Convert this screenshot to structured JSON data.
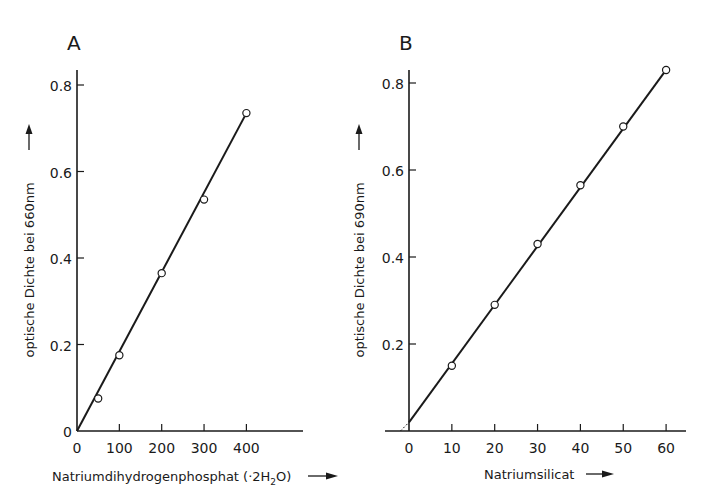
{
  "chart_data": [
    {
      "panel": "A",
      "type": "line",
      "title": "A",
      "xlabel": "Natriumdihydrogenphosphat (·2H2O)",
      "ylabel": "optische Dichte bei 660nm",
      "x_ticks": [
        0,
        100,
        200,
        300,
        400
      ],
      "y_ticks": [
        0,
        0.2,
        0.4,
        0.6,
        0.8
      ],
      "y_tick_labels": [
        "0",
        "0.2",
        "0.4",
        "0.6",
        "0.8"
      ],
      "xlim": [
        0,
        520
      ],
      "ylim": [
        0,
        0.84
      ],
      "grid": false,
      "series": [
        {
          "name": "Messpunkte",
          "x": [
            50,
            100,
            200,
            300,
            400
          ],
          "values": [
            0.075,
            0.175,
            0.365,
            0.535,
            0.735
          ]
        }
      ],
      "fit_line": {
        "x": [
          0,
          400
        ],
        "y": [
          0.0,
          0.735
        ]
      }
    },
    {
      "panel": "B",
      "type": "line",
      "title": "B",
      "xlabel": "Natriumsilicat",
      "ylabel": "optische Dichte bei 690nm",
      "x_ticks": [
        0,
        10,
        20,
        30,
        40,
        50,
        60
      ],
      "y_ticks": [
        0.2,
        0.4,
        0.6,
        0.8
      ],
      "y_tick_labels": [
        "0.2",
        "0.4",
        "0.6",
        "0.8"
      ],
      "xlim": [
        -6,
        65
      ],
      "ylim": [
        0,
        0.84
      ],
      "grid": false,
      "series": [
        {
          "name": "Messpunkte",
          "x": [
            10,
            20,
            30,
            40,
            50,
            60
          ],
          "values": [
            0.15,
            0.29,
            0.43,
            0.565,
            0.7,
            0.83
          ]
        }
      ],
      "fit_line": {
        "x": [
          0,
          60
        ],
        "y": [
          0.02,
          0.83
        ]
      },
      "extrapolation_dashed": {
        "x": [
          -2,
          0
        ],
        "y": [
          0.0,
          0.02
        ]
      }
    }
  ],
  "labels": {
    "panel_a": "A",
    "panel_b": "B",
    "a_ylabel": "optische Dichte bei 660nm",
    "b_ylabel": "optische Dichte bei 690nm",
    "a_xlabel_main": "Natriumdihydrogenphosphat (·2H",
    "a_xlabel_sub": "2",
    "a_xlabel_end": "O)",
    "b_xlabel": "Natriumsilicat"
  }
}
